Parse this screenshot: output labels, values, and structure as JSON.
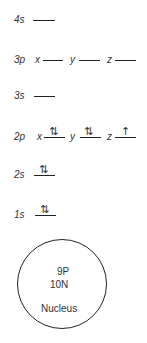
{
  "diagram": {
    "type": "electron orbital energy diagram",
    "levels": [
      {
        "name": "4s",
        "orbitals": [
          {
            "axis": "",
            "electrons": ""
          }
        ]
      },
      {
        "name": "3p",
        "orbitals": [
          {
            "axis": "x",
            "electrons": ""
          },
          {
            "axis": "y",
            "electrons": ""
          },
          {
            "axis": "z",
            "electrons": ""
          }
        ]
      },
      {
        "name": "3s",
        "orbitals": [
          {
            "axis": "",
            "electrons": ""
          }
        ]
      },
      {
        "name": "2p",
        "orbitals": [
          {
            "axis": "x",
            "electrons": "⇅"
          },
          {
            "axis": "y",
            "electrons": "⇅"
          },
          {
            "axis": "z",
            "electrons": "↑"
          }
        ]
      },
      {
        "name": "2s",
        "orbitals": [
          {
            "axis": "",
            "electrons": "⇅"
          }
        ]
      },
      {
        "name": "1s",
        "orbitals": [
          {
            "axis": "",
            "electrons": "⇅"
          }
        ]
      }
    ],
    "nucleus": {
      "protons": "9P",
      "neutrons": "10N",
      "label": "Nucleus"
    }
  }
}
